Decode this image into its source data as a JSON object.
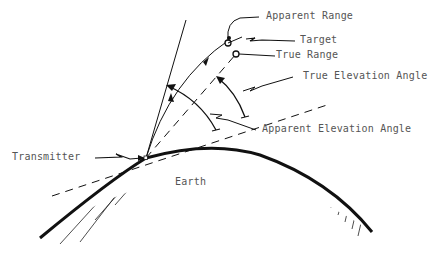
{
  "diagram": {
    "type": "refraction-geometry",
    "labels": {
      "apparent_range": "Apparent Range",
      "target": "Target",
      "true_range": "True Range",
      "true_elevation_angle": "True Elevation Angle",
      "apparent_elevation_angle": "Apparent Elevation Angle",
      "transmitter": "Transmitter",
      "earth": "Earth"
    },
    "colors": {
      "line": "#111111",
      "text": "#555555",
      "background": "#ffffff"
    }
  }
}
